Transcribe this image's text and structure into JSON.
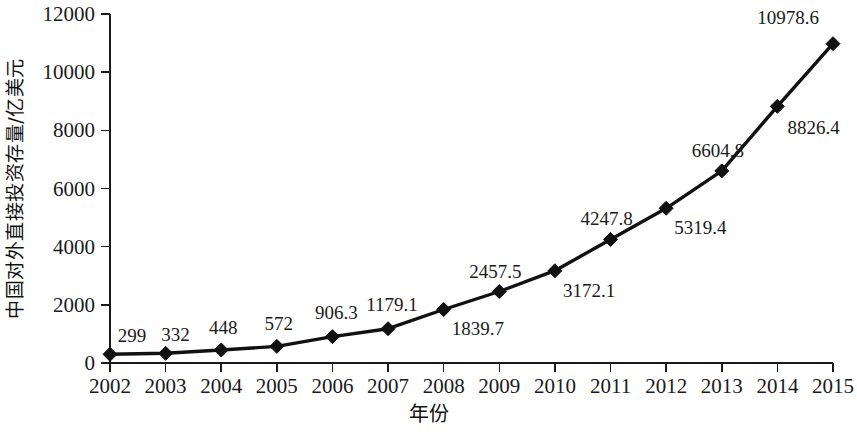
{
  "chart_data": {
    "type": "line",
    "title": "",
    "xlabel": "年份",
    "ylabel": "中国对外直接投资存量/亿美元",
    "categories": [
      "2002",
      "2003",
      "2004",
      "2005",
      "2006",
      "2007",
      "2008",
      "2009",
      "2010",
      "2011",
      "2012",
      "2013",
      "2014",
      "2015"
    ],
    "values": [
      299,
      332,
      448,
      572,
      906.3,
      1179.1,
      1839.7,
      2457.5,
      3172.1,
      4247.8,
      5319.4,
      6604.8,
      8826.4,
      10978.6
    ],
    "point_labels": [
      "299",
      "332",
      "448",
      "572",
      "906.3",
      "1179.1",
      "1839.7",
      "2457.5",
      "3172.1",
      "4247.8",
      "5319.4",
      "6604.8",
      "8826.4",
      "10978.6"
    ],
    "label_positions": [
      "above",
      "above",
      "above",
      "above",
      "above",
      "above",
      "below",
      "above",
      "below",
      "above",
      "below",
      "above",
      "below",
      "above"
    ],
    "ylim": [
      0,
      12000
    ],
    "ytick_labels": [
      "0",
      "2000",
      "4000",
      "6000",
      "8000",
      "10000",
      "12000"
    ],
    "ytick_values": [
      0,
      2000,
      4000,
      6000,
      8000,
      10000,
      12000
    ],
    "xtick_labels": [
      "2002",
      "2003",
      "2004",
      "2005",
      "2006",
      "2007",
      "2008",
      "2009",
      "2010",
      "2011",
      "2012",
      "2013",
      "2014",
      "2015"
    ],
    "grid": false,
    "legend": null,
    "series": [
      {
        "name": "中国对外直接投资存量",
        "values": [
          299,
          332,
          448,
          572,
          906.3,
          1179.1,
          1839.7,
          2457.5,
          3172.1,
          4247.8,
          5319.4,
          6604.8,
          8826.4,
          10978.6
        ]
      }
    ],
    "marker": "diamond",
    "line_color": "#111111",
    "marker_color": "#111111",
    "axis_color": "#1a1a1a",
    "background_color": "#ffffff"
  }
}
